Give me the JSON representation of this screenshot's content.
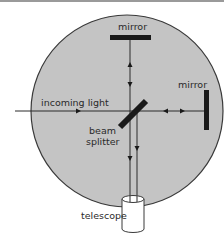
{
  "diagram": {
    "labels": {
      "top_mirror": "mirror",
      "right_mirror": "mirror",
      "incoming_light": "incoming light",
      "beam_splitter_line1": "beam",
      "beam_splitter_line2": "splitter",
      "telescope": "telescope"
    },
    "colors": {
      "chamber_fill": "#c4c4c4",
      "chamber_stroke": "#3a3a3a",
      "mirror": "#1a1a1a",
      "beam": "#2a2a2a",
      "telescope_fill": "#ffffff"
    }
  }
}
